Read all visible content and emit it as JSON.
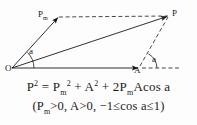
{
  "diagram": {
    "type": "vector-parallelogram",
    "points": {
      "origin_label": "O",
      "pm_vertex_label": "P",
      "pm_vertex_sub": "m",
      "resultant_label": "P",
      "a_vertex_label": "A"
    },
    "angles": {
      "origin_angle_label": "a",
      "a_point_angle_label": "a"
    },
    "geometry": {
      "O": [
        12,
        68
      ],
      "Pm": [
        58,
        17
      ],
      "P": [
        168,
        16
      ],
      "A": [
        138,
        68
      ],
      "dashed_axis_end": [
        178,
        68
      ],
      "solid_edges": [
        "O-Pm",
        "O-P",
        "O-A"
      ],
      "dashed_edges": [
        "Pm-P",
        "A-P",
        "A-dashed_axis_end"
      ]
    },
    "colors": {
      "stroke": "#1a1a1a",
      "background": "#fdfdfd"
    }
  },
  "formulas": {
    "main": {
      "lhs_base": "P",
      "lhs_exp": "2",
      "eq": "=",
      "t1_base": "P",
      "t1_sub": "m",
      "t1_exp": "2",
      "plus1": "+",
      "t2_base": "A",
      "t2_exp": "2",
      "plus2": "+",
      "t3": "2P",
      "t3_sub": "m",
      "t3_tail": "Acos a"
    },
    "conditions": {
      "open": "(P",
      "c1_sub": "m",
      "c1_tail": ">0, A>0, −1≤cos a≤1)"
    }
  }
}
